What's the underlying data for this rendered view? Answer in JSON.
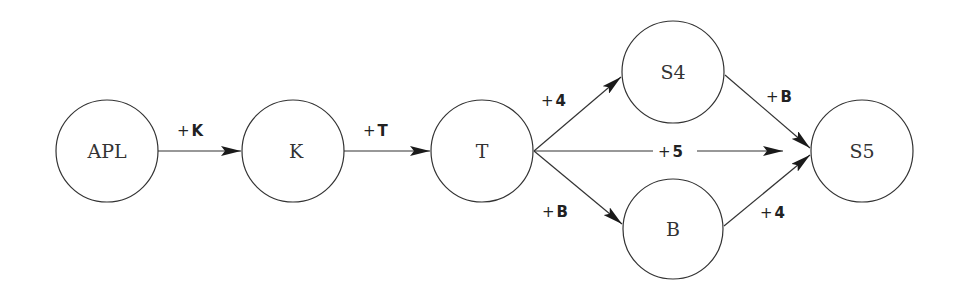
{
  "diagram": {
    "nodes": [
      {
        "id": "APL",
        "label": "APL",
        "cx": 107,
        "cy": 151,
        "r": 51
      },
      {
        "id": "K",
        "label": "K",
        "cx": 293,
        "cy": 151,
        "r": 51
      },
      {
        "id": "T",
        "label": "T",
        "cx": 482,
        "cy": 151,
        "r": 51
      },
      {
        "id": "S4",
        "label": "S4",
        "cx": 673,
        "cy": 72,
        "r": 51
      },
      {
        "id": "B",
        "label": "B",
        "cx": 673,
        "cy": 229,
        "r": 50
      },
      {
        "id": "S5",
        "label": "S5",
        "cx": 862,
        "cy": 151,
        "r": 51
      }
    ],
    "edges": [
      {
        "from": "APL",
        "to": "K",
        "label_prefix": "+",
        "label_value": "K"
      },
      {
        "from": "K",
        "to": "T",
        "label_prefix": "+",
        "label_value": "T"
      },
      {
        "from": "T",
        "to": "S4",
        "label_prefix": "+",
        "label_value": "4"
      },
      {
        "from": "T",
        "to": "S5",
        "label_prefix": "+",
        "label_value": "5"
      },
      {
        "from": "T",
        "to": "B",
        "label_prefix": "+",
        "label_value": "B"
      },
      {
        "from": "S4",
        "to": "S5",
        "label_prefix": "+",
        "label_value": "B"
      },
      {
        "from": "B",
        "to": "S5",
        "label_prefix": "+",
        "label_value": "4"
      }
    ]
  }
}
